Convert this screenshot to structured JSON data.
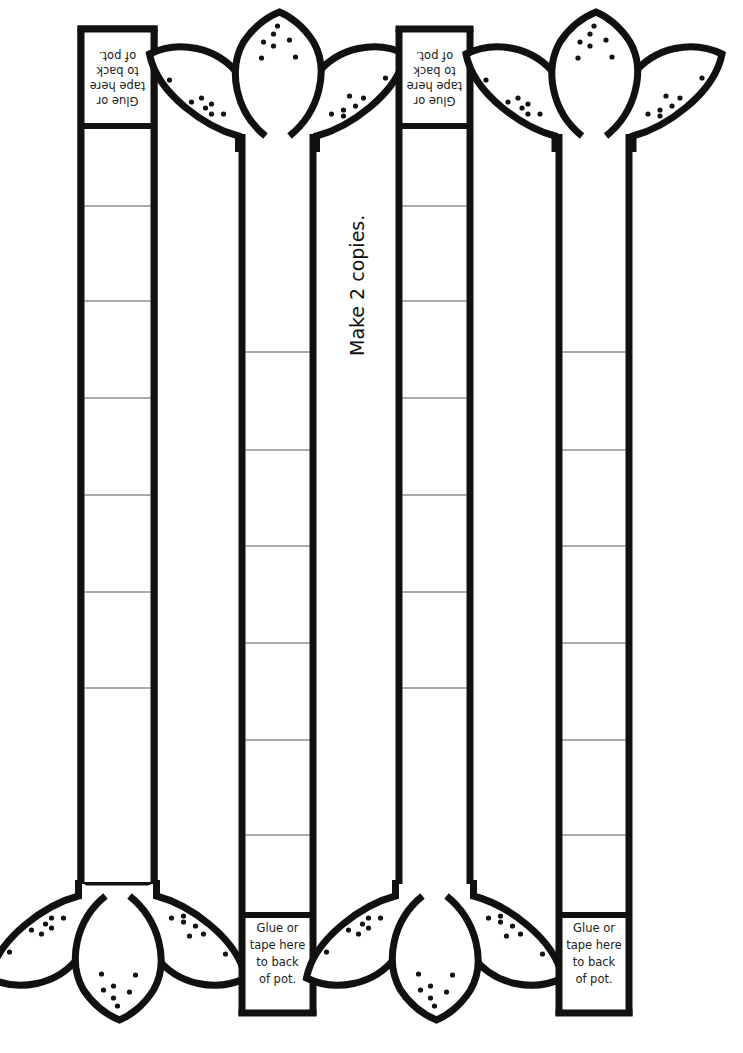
{
  "instruction": "Make 2 copies.",
  "tab_text": {
    "line1": "Glue or",
    "line2": "tape here",
    "line3": "to back",
    "line4": "of pot."
  },
  "strips": [
    {
      "id": "strip-1",
      "flower_position": "bottom",
      "tab_position": "top",
      "tab_text_orientation": "upside-down",
      "sections": 7
    },
    {
      "id": "strip-2",
      "flower_position": "top",
      "tab_position": "bottom",
      "tab_text_orientation": "upright",
      "sections": 7
    },
    {
      "id": "strip-3",
      "flower_position": "bottom",
      "tab_position": "top",
      "tab_text_orientation": "upside-down",
      "sections": 7
    },
    {
      "id": "strip-4",
      "flower_position": "top",
      "tab_position": "bottom",
      "tab_text_orientation": "upright",
      "sections": 7
    }
  ],
  "colors": {
    "ink": "#111111",
    "paper": "#ffffff",
    "divider": "#555555"
  }
}
